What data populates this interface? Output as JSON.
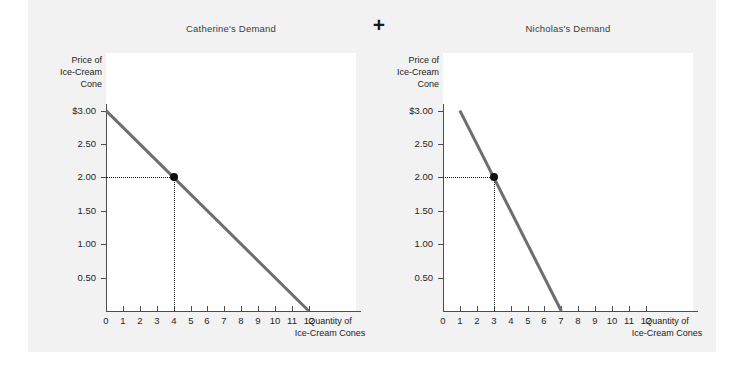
{
  "figure": {
    "background_color": "#ffffff",
    "panel_color": "#f2f2f2",
    "plot_color": "#ffffff",
    "curve_color": "#6e6e6e",
    "operator": "+"
  },
  "panels": [
    {
      "id": "catherine",
      "title": "Catherine's Demand",
      "y_axis_label": "Price of\nIce-Cream\nCone",
      "x_axis_label": "Quantity of\nIce-Cream Cones",
      "y_ticks": [
        "$3.00",
        "2.50",
        "2.00",
        "1.50",
        "1.00",
        "0.50"
      ],
      "x_ticks": [
        "0",
        "1",
        "2",
        "3",
        "4",
        "5",
        "6",
        "7",
        "8",
        "9",
        "10",
        "11",
        "12"
      ],
      "equilibrium": {
        "price": "2.00",
        "quantity": "4"
      }
    },
    {
      "id": "nicholas",
      "title": "Nicholas's Demand",
      "y_axis_label": "Price of\nIce-Cream\nCone",
      "x_axis_label": "Quantity of\nIce-Cream Cones",
      "y_ticks": [
        "$3.00",
        "2.50",
        "2.00",
        "1.50",
        "1.00",
        "0.50"
      ],
      "x_ticks": [
        "0",
        "1",
        "2",
        "3",
        "4",
        "5",
        "6",
        "7",
        "8",
        "9",
        "10",
        "11",
        "12"
      ],
      "equilibrium": {
        "price": "2.00",
        "quantity": "3"
      }
    }
  ],
  "chart_data": [
    {
      "type": "line",
      "title": "Catherine's Demand",
      "xlabel": "Quantity of Ice-Cream Cones",
      "ylabel": "Price of Ice-Cream Cone",
      "xlim": [
        0,
        12
      ],
      "ylim": [
        0,
        3
      ],
      "xticks": [
        0,
        1,
        2,
        3,
        4,
        5,
        6,
        7,
        8,
        9,
        10,
        11,
        12
      ],
      "yticks": [
        0.5,
        1.0,
        1.5,
        2.0,
        2.5,
        3.0
      ],
      "ytick_labels": [
        "0.50",
        "1.00",
        "1.50",
        "2.00",
        "2.50",
        "$3.00"
      ],
      "grid": false,
      "legend": "none",
      "series": [
        {
          "name": "Catherine's demand curve",
          "x": [
            0,
            12
          ],
          "y": [
            3.0,
            0.0
          ],
          "color": "#6e6e6e"
        }
      ],
      "annotations": [
        {
          "type": "point",
          "label": "equilibrium point",
          "x": 4,
          "y": 2.0,
          "marker": "filled-circle",
          "guides": "dotted to both axes"
        }
      ]
    },
    {
      "type": "line",
      "title": "Nicholas's Demand",
      "xlabel": "Quantity of Ice-Cream Cones",
      "ylabel": "Price of Ice-Cream Cone",
      "xlim": [
        0,
        12
      ],
      "ylim": [
        0,
        3
      ],
      "xticks": [
        0,
        1,
        2,
        3,
        4,
        5,
        6,
        7,
        8,
        9,
        10,
        11,
        12
      ],
      "yticks": [
        0.5,
        1.0,
        1.5,
        2.0,
        2.5,
        3.0
      ],
      "ytick_labels": [
        "0.50",
        "1.00",
        "1.50",
        "2.00",
        "2.50",
        "$3.00"
      ],
      "grid": false,
      "legend": "none",
      "series": [
        {
          "name": "Nicholas's demand curve",
          "x": [
            1,
            7
          ],
          "y": [
            3.0,
            0.0
          ],
          "color": "#6e6e6e"
        }
      ],
      "annotations": [
        {
          "type": "point",
          "label": "equilibrium point",
          "x": 3,
          "y": 2.0,
          "marker": "filled-circle",
          "guides": "dotted to both axes"
        }
      ]
    }
  ]
}
